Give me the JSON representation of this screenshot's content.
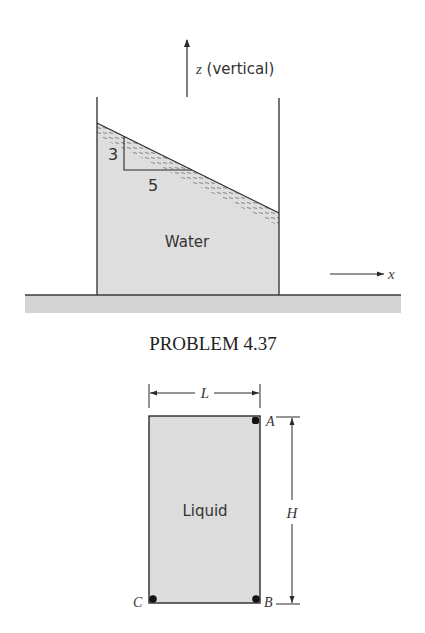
{
  "figure_top": {
    "axis_z": {
      "symbol": "z",
      "label": " (vertical)"
    },
    "axis_x": {
      "symbol": "x"
    },
    "fluid_label": "Water",
    "slope": {
      "rise": "3",
      "run": "5"
    }
  },
  "caption": "PROBLEM 4.37",
  "figure_bottom": {
    "fluid_label": "Liquid",
    "width_label": "L",
    "height_label": "H",
    "points": {
      "a": "A",
      "b": "B",
      "c": "C"
    }
  },
  "colors": {
    "fluid_fill": "#dedede",
    "ground_fill": "#d4d4d4",
    "line": "#2a2a2a",
    "dash": "#6a6a6a"
  }
}
